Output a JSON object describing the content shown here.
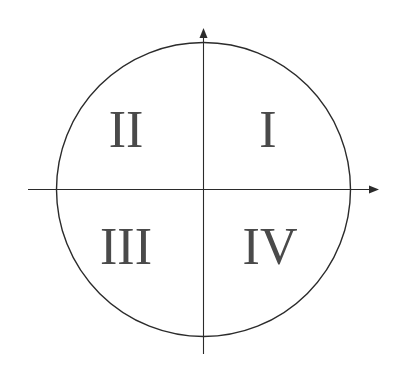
{
  "diagram": {
    "type": "unit-circle-quadrants",
    "colors": {
      "line": "#2b2b2b",
      "label": "#4a4a4a",
      "background": "#ffffff"
    },
    "quadrants": [
      {
        "id": "I",
        "label": "I"
      },
      {
        "id": "II",
        "label": "II"
      },
      {
        "id": "III",
        "label": "III"
      },
      {
        "id": "IV",
        "label": "IV"
      }
    ]
  }
}
